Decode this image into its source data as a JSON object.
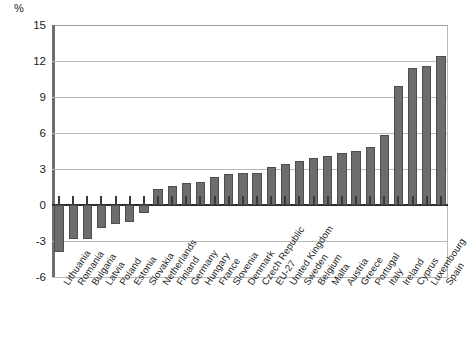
{
  "chart_data": {
    "type": "bar",
    "title": "",
    "subtitle": "",
    "unit_label": "%",
    "xlabel": "",
    "ylabel": "",
    "ylim": [
      -6,
      15
    ],
    "yticks": [
      15,
      12,
      9,
      6,
      3,
      0,
      -3,
      -6
    ],
    "grid": true,
    "legend": "none",
    "orientation": "vertical",
    "bar_color": "#6d6d6d",
    "bar_border_color": "#4d4d4d",
    "categories": [
      "Lithuania",
      "Romania",
      "Bulgaria",
      "Latvia",
      "Poland",
      "Estonia",
      "Slovakia",
      "Netherlands",
      "Finland",
      "Germany",
      "Hungary",
      "France",
      "Slovenia",
      "Denmark",
      "Czech Republic",
      "EU-27",
      "United Kingdom",
      "Sweden",
      "Belgium",
      "Malta",
      "Austria",
      "Greece",
      "Portugal",
      "Italy",
      "Ireland",
      "Cyprus",
      "Luxembourg",
      "Spain"
    ],
    "values": [
      -3.9,
      -2.8,
      -2.8,
      -1.9,
      -1.6,
      -1.4,
      -0.7,
      1.3,
      1.6,
      1.8,
      1.9,
      2.3,
      2.6,
      2.7,
      2.7,
      3.2,
      3.4,
      3.7,
      3.9,
      4.1,
      4.3,
      4.5,
      4.8,
      5.8,
      9.9,
      11.4,
      11.6,
      12.4
    ]
  }
}
